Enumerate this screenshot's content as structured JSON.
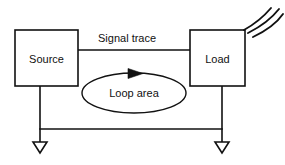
{
  "diagram": {
    "stroke_color": "#111111",
    "background_color": "#ffffff",
    "blocks": [
      {
        "id": "source",
        "label": "Source"
      },
      {
        "id": "load",
        "label": "Load"
      }
    ],
    "labels": {
      "signal_trace": "Signal trace",
      "loop_area": "Loop area"
    },
    "icons": {
      "ground_left": "ground-symbol",
      "ground_right": "ground-symbol",
      "radiation": "radiation-arcs",
      "current_direction": "arrowhead-right"
    },
    "counts": {
      "radiation_arcs": 3,
      "ground_symbols": 2
    }
  }
}
